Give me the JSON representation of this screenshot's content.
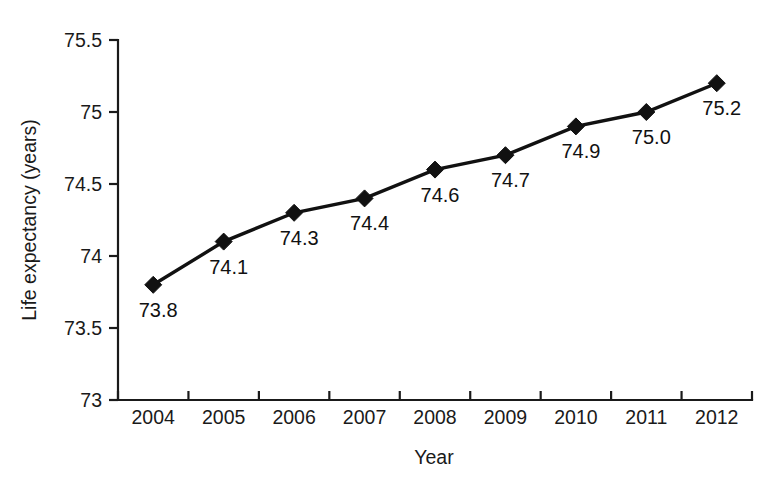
{
  "chart_data": {
    "type": "line",
    "title": "",
    "xlabel": "Year",
    "ylabel": "Life expectancy (years)",
    "categories": [
      "2004",
      "2005",
      "2006",
      "2007",
      "2008",
      "2009",
      "2010",
      "2011",
      "2012"
    ],
    "values": [
      73.8,
      74.1,
      74.3,
      74.4,
      74.6,
      74.7,
      74.9,
      75.0,
      75.2
    ],
    "point_labels": [
      "73.8",
      "74.1",
      "74.3",
      "74.4",
      "74.6",
      "74.7",
      "74.9",
      "75.0",
      "75.2"
    ],
    "ylim": [
      73,
      75.5
    ],
    "yticks": [
      73,
      73.5,
      74,
      74.5,
      75,
      75.5
    ],
    "ytick_labels": [
      "73",
      "73.5",
      "74",
      "74.5",
      "75",
      "75.5"
    ],
    "grid": false,
    "legend": false,
    "marker": "diamond",
    "line_color": "#111111",
    "marker_color": "#111111",
    "background_color": "#ffffff"
  },
  "axis_titles": {
    "x": "Year",
    "y": "Life expectancy (years)"
  }
}
